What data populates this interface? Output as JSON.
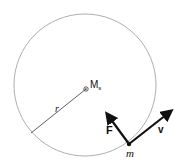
{
  "diagram": {
    "central_mass": {
      "label": "M",
      "subscript": "s"
    },
    "radius_label": "r",
    "orbiting_mass_label": "m",
    "force_label": "F",
    "velocity_label": "v",
    "colors": {
      "circle": "#999999",
      "line": "#333333",
      "arrow": "#111111"
    }
  }
}
